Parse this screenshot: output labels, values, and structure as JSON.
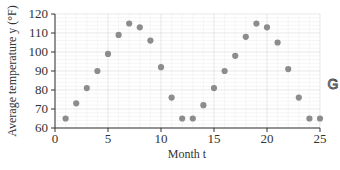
{
  "chart_data": {
    "type": "scatter",
    "title": "",
    "xlabel": "Month t",
    "ylabel": "Average temperature y (°F)",
    "xlim": [
      0,
      25
    ],
    "ylim": [
      60,
      120
    ],
    "xticks": [
      0,
      5,
      10,
      15,
      20,
      25
    ],
    "yticks": [
      60,
      70,
      80,
      90,
      100,
      110,
      120
    ],
    "grid": true,
    "series": [
      {
        "name": "Average temperature",
        "color": "#8c8c8c",
        "x": [
          1,
          2,
          3,
          4,
          5,
          6,
          7,
          8,
          9,
          10,
          11,
          12,
          13,
          14,
          15,
          16,
          17,
          18,
          19,
          20,
          21,
          22,
          23,
          24,
          25
        ],
        "y": [
          65,
          73,
          81,
          90,
          99,
          109,
          115,
          113,
          106,
          92,
          76,
          65,
          65,
          72,
          81,
          90,
          98,
          108,
          115,
          113,
          105,
          91,
          76,
          65,
          65
        ]
      }
    ]
  },
  "icon": {
    "name": "graphing-calculator-icon",
    "glyph": "G"
  }
}
